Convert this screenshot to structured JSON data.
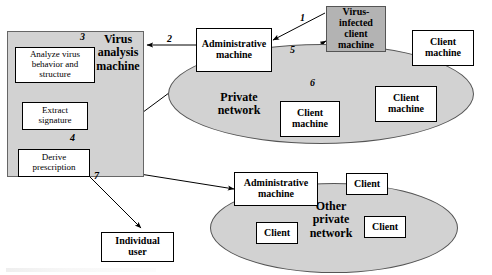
{
  "diagram": {
    "type": "flow-network-diagram",
    "panel": {
      "title": "Virus\nanalysis\nmachine",
      "title_lines": [
        "Virus",
        "analysis",
        "machine"
      ],
      "fill": "#d2d2d2"
    },
    "process_boxes": [
      {
        "id": "analyze",
        "label": "Analyze virus behavior and structure",
        "lines": [
          "Analyze virus",
          "behavior and",
          "structure"
        ]
      },
      {
        "id": "extract",
        "label": "Extract signature",
        "lines": [
          "Extract",
          "signature"
        ]
      },
      {
        "id": "derive",
        "label": "Derive prescription",
        "lines": [
          "Derive",
          "prescription"
        ]
      }
    ],
    "networks": [
      {
        "id": "private-network",
        "title": "Private network",
        "lines": [
          "Private",
          "network"
        ],
        "fill": "#d2d2d2"
      },
      {
        "id": "other-private-network",
        "title": "Other private network",
        "lines": [
          "Other",
          "private",
          "network"
        ],
        "fill": "#d2d2d2"
      }
    ],
    "machines": [
      {
        "id": "admin-machine-1",
        "label": "Administrative machine",
        "lines": [
          "Administrative",
          "machine"
        ],
        "shaded": false
      },
      {
        "id": "virus-infected-client",
        "label": "Virus-infected client machine",
        "lines": [
          "Virus-",
          "infected",
          "client",
          "machine"
        ],
        "shaded": true
      },
      {
        "id": "client-machine-topright",
        "label": "Client machine",
        "lines": [
          "Client",
          "machine"
        ],
        "shaded": false
      },
      {
        "id": "client-machine-bottomcenter",
        "label": "Client machine",
        "lines": [
          "Client",
          "machine"
        ],
        "shaded": false
      },
      {
        "id": "client-machine-bottomright",
        "label": "Client machine",
        "lines": [
          "Client",
          "machine"
        ],
        "shaded": false
      },
      {
        "id": "admin-machine-2",
        "label": "Administrative machine",
        "lines": [
          "Administrative",
          "machine"
        ],
        "shaded": false
      },
      {
        "id": "client-other-top",
        "label": "Client",
        "lines": [
          "Client"
        ],
        "shaded": false
      },
      {
        "id": "client-other-left",
        "label": "Client",
        "lines": [
          "Client"
        ],
        "shaded": false
      },
      {
        "id": "client-other-right",
        "label": "Client",
        "lines": [
          "Client"
        ],
        "shaded": false
      },
      {
        "id": "individual-user",
        "label": "Individual user",
        "lines": [
          "Individual",
          "user"
        ],
        "shaded": false
      }
    ],
    "edge_labels": [
      {
        "id": "edge-1",
        "text": "1",
        "from": "virus-infected-client",
        "to": "admin-machine-1"
      },
      {
        "id": "edge-2",
        "text": "2",
        "from": "admin-machine-1",
        "to": "virus-analysis-machine"
      },
      {
        "id": "edge-3",
        "text": "3",
        "from": "virus-analysis-machine-input",
        "to": "analyze"
      },
      {
        "id": "edge-4",
        "text": "4",
        "from": "derive",
        "to": "admin-machine-1"
      },
      {
        "id": "edge-5",
        "text": "5",
        "from": "admin-machine-1",
        "to": "virus-infected-client"
      },
      {
        "id": "edge-6",
        "text": "6",
        "from": "admin-machine-1",
        "to": "client-machines"
      },
      {
        "id": "edge-7",
        "text": "7",
        "from": "derive",
        "to": "admin-machine-2-and-individual-user"
      }
    ],
    "colors": {
      "panel_fill": "#d2d2d2",
      "ellipse_fill": "#d2d2d2",
      "shaded_box_fill": "#b3b3b3",
      "box_fill": "#ffffff",
      "stroke": "#000000",
      "background": "#ffffff"
    }
  }
}
